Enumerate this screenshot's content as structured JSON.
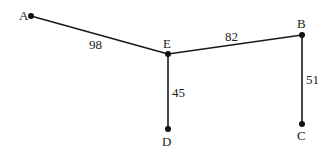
{
  "diagram": {
    "type": "weighted-graph",
    "nodes": [
      {
        "id": "A",
        "label": "A",
        "x": 31,
        "y": 16,
        "lx": 19,
        "ly": 20
      },
      {
        "id": "E",
        "label": "E",
        "x": 168,
        "y": 54,
        "lx": 163,
        "ly": 48
      },
      {
        "id": "B",
        "label": "B",
        "x": 302,
        "y": 35,
        "lx": 297,
        "ly": 28
      },
      {
        "id": "D",
        "label": "D",
        "x": 168,
        "y": 129,
        "lx": 162,
        "ly": 146
      },
      {
        "id": "C",
        "label": "C",
        "x": 302,
        "y": 124,
        "lx": 297,
        "ly": 140
      }
    ],
    "edges": [
      {
        "from": "A",
        "to": "E",
        "weight": "98",
        "wx": 89,
        "wy": 49
      },
      {
        "from": "E",
        "to": "B",
        "weight": "82",
        "wx": 225,
        "wy": 41
      },
      {
        "from": "E",
        "to": "D",
        "weight": "45",
        "wx": 172,
        "wy": 97
      },
      {
        "from": "B",
        "to": "C",
        "weight": "51",
        "wx": 306,
        "wy": 84
      }
    ]
  }
}
